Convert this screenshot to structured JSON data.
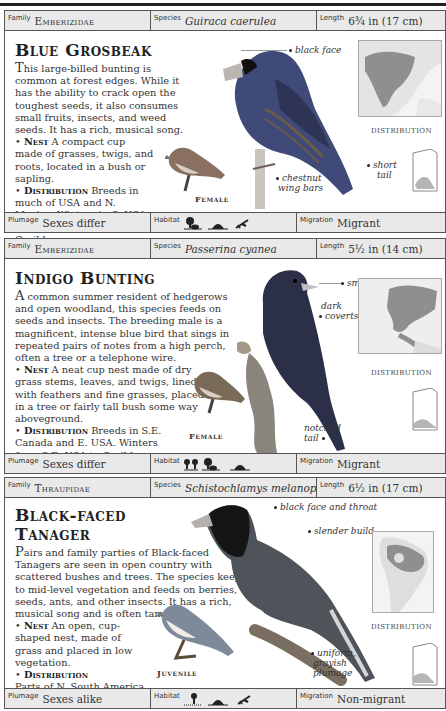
{
  "entries": [
    {
      "family_label": "Family",
      "family": "Emberizidae",
      "species_label": "Species",
      "species": "Guiraca caerulea",
      "length_label": "Length",
      "length": "6¾ in (17 cm)",
      "title": "Blue Grosbeak",
      "description_dropcap": "T",
      "description": "his large-billed bunting is common at forest edges. While it has the ability to crack open the toughest seeds, it also consumes small fruits, insects, and weed seeds. It has a rich, musical song.",
      "nest_label": "Nest",
      "nest": "A compact cup made of grasses, twigs, and roots, located in a bush or sapling.",
      "distribution_label": "Distribution",
      "distribution": "Breeds in much of USA and N. Mexico. Winters in S. USA, Central America, and Caribbean.",
      "inset_caption": "Female",
      "map_caption": "DISTRIBUTION",
      "annotations": [
        "black face",
        "chestnut",
        "wing bars",
        "short",
        "tail"
      ],
      "plumage_label": "Plumage",
      "plumage": "Sexes differ",
      "habitat_label": "Habitat",
      "habitat_icons": [
        "forest-edge-icon",
        "scrub-icon",
        "open-country-icon"
      ],
      "migration_label": "Migration",
      "migration": "Migrant",
      "bird_color": "#3a4a7a"
    },
    {
      "family_label": "Family",
      "family": "Emberizidae",
      "species_label": "Species",
      "species": "Passerina cyanea",
      "length_label": "Length",
      "length": "5½ in (14 cm)",
      "title": "Indigo Bunting",
      "description_dropcap": "A",
      "description": " common summer resident of hedgerows and open woodland, this species feeds on seeds and insects. The breeding male is a magnificent, intense blue bird that sings in repeated pairs of notes from a high perch, often a tree or a telephone wire.",
      "nest_label": "Nest",
      "nest": "A neat cup nest made of dry grass stems, leaves, and twigs, lined with feathers and fine grasses, placed in a tree or fairly tall bush some way aboveground.",
      "distribution_label": "Distribution",
      "distribution": "Breeds in S.E. Canada and E. USA. Winters from S.E. USA to Caribbean Islands and Central America.",
      "inset_caption": "Female",
      "map_caption": "DISTRIBUTION",
      "annotations": [
        "small bill",
        "dark",
        "coverts",
        "notched",
        "tail"
      ],
      "plumage_label": "Plumage",
      "plumage": "Sexes differ",
      "habitat_label": "Habitat",
      "habitat_icons": [
        "woodland-icon",
        "forest-edge-icon",
        "scrub-icon"
      ],
      "migration_label": "Migration",
      "migration": "Migrant",
      "bird_color": "#2a2f4a"
    },
    {
      "family_label": "Family",
      "family": "Thraupidae",
      "species_label": "Species",
      "species": "Schistochlamys melanopis",
      "length_label": "Length",
      "length": "6½ in (17 cm)",
      "title_line1": "Black-faced",
      "title_line2": "Tanager",
      "description_dropcap": "P",
      "description": "airs and family parties of Black-faced Tanagers are seen in open country with scattered bushes and trees. The species keeps to mid-level vegetation and feeds on berries, seeds, ants, and other insects. It has a rich, musical song and is often tame.",
      "nest_label": "Nest",
      "nest": "An open, cup-shaped nest, made of grass and placed in low vegetation.",
      "distribution_label": "Distribution",
      "distribution": "Parts of N. South America.",
      "inset_caption": "Juvenile",
      "map_caption": "DISTRIBUTION",
      "annotations": [
        "black face and throat",
        "slender build",
        "uniform,",
        "grayish",
        "plumage"
      ],
      "plumage_label": "Plumage",
      "plumage": "Sexes alike",
      "habitat_label": "Habitat",
      "habitat_icons": [
        "tree-grassland-icon",
        "scrub-icon",
        "open-country-icon"
      ],
      "migration_label": "Migration",
      "migration": "Non-migrant",
      "bird_color": "#555a60"
    }
  ]
}
